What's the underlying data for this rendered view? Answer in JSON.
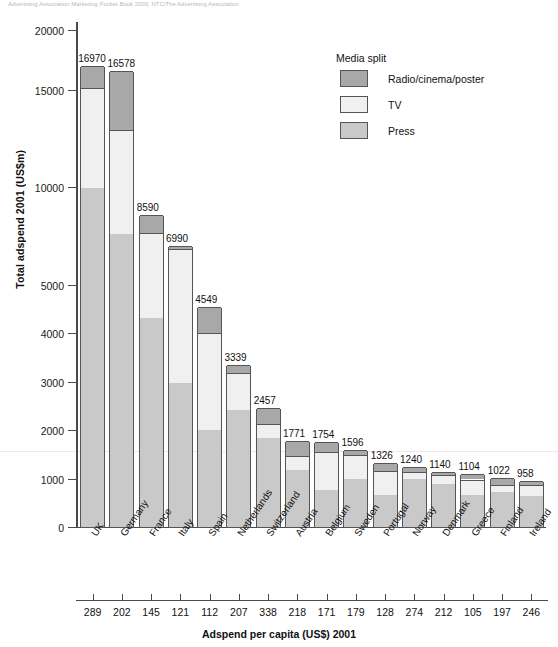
{
  "source_header": "Advertising Association Marketing Pocket Book 2003, NTC/The Advertising Association",
  "axes": {
    "y_title": "Total adspend 2001 (US$m)",
    "x_title": "Adspend per capita (US$) 2001",
    "y_ticks": [
      "20000",
      "15000",
      "10000",
      "5000",
      "4000",
      "3000",
      "2000",
      "1000",
      "0"
    ]
  },
  "legend": {
    "title": "Media split",
    "items": [
      {
        "label": "Radio/cinema/poster",
        "color": "#a8a8a8",
        "key": "radio"
      },
      {
        "label": "TV",
        "color": "#f0f0f0",
        "key": "tv"
      },
      {
        "label": "Press",
        "color": "#c9c9c9",
        "key": "press"
      }
    ]
  },
  "chart_data": {
    "type": "bar",
    "xlabel": "Adspend per capita (US$) 2001",
    "ylabel": "Total adspend 2001 (US$m)",
    "stacked": true,
    "grid": false,
    "legend_position": "top-right",
    "y_axis_note": "broken / non-linear scale: 0-5000 expanded, 5000-20000 compressed",
    "y_ticks": [
      0,
      1000,
      2000,
      3000,
      4000,
      5000,
      10000,
      15000,
      20000
    ],
    "ylim": [
      0,
      20000
    ],
    "categories": [
      "UK",
      "Germany",
      "France",
      "Italy",
      "Spain",
      "Netherlands",
      "Switzerland",
      "Austria",
      "Belgium",
      "Sweden",
      "Portugal",
      "Norway",
      "Denmark",
      "Greece",
      "Finland",
      "Ireland"
    ],
    "totals": [
      16970,
      16578,
      8590,
      6990,
      4549,
      3339,
      2457,
      1771,
      1754,
      1596,
      1326,
      1240,
      1140,
      1104,
      1022,
      958
    ],
    "per_capita": [
      289,
      202,
      145,
      121,
      112,
      207,
      338,
      218,
      171,
      179,
      128,
      274,
      212,
      105,
      197,
      246
    ],
    "series": [
      {
        "name": "Press",
        "values": [
          9950,
          7580,
          4310,
          2985,
          2000,
          2425,
          1845,
          1180,
          770,
          1000,
          670,
          1000,
          900,
          660,
          720,
          640
        ]
      },
      {
        "name": "TV",
        "values": [
          5250,
          5350,
          3330,
          3840,
          2000,
          760,
          290,
          290,
          790,
          480,
          490,
          150,
          180,
          330,
          160,
          230
        ]
      },
      {
        "name": "Radio/cinema/poster",
        "values": [
          1770,
          3648,
          950,
          165,
          549,
          154,
          322,
          301,
          194,
          116,
          166,
          90,
          60,
          114,
          142,
          88
        ]
      }
    ]
  },
  "bars": [
    {
      "country": "UK",
      "total": "16970",
      "per_capita": "289"
    },
    {
      "country": "Germany",
      "total": "16578",
      "per_capita": "202"
    },
    {
      "country": "France",
      "total": "8590",
      "per_capita": "145"
    },
    {
      "country": "Italy",
      "total": "6990",
      "per_capita": "121"
    },
    {
      "country": "Spain",
      "total": "4549",
      "per_capita": "112"
    },
    {
      "country": "Netherlands",
      "total": "3339",
      "per_capita": "207"
    },
    {
      "country": "Switzerland",
      "total": "2457",
      "per_capita": "338"
    },
    {
      "country": "Austria",
      "total": "1771",
      "per_capita": "218"
    },
    {
      "country": "Belgium",
      "total": "1754",
      "per_capita": "171"
    },
    {
      "country": "Sweden",
      "total": "1596",
      "per_capita": "179"
    },
    {
      "country": "Portugal",
      "total": "1326",
      "per_capita": "128"
    },
    {
      "country": "Norway",
      "total": "1240",
      "per_capita": "274"
    },
    {
      "country": "Denmark",
      "total": "1140",
      "per_capita": "212"
    },
    {
      "country": "Greece",
      "total": "1104",
      "per_capita": "105"
    },
    {
      "country": "Finland",
      "total": "1022",
      "per_capita": "197"
    },
    {
      "country": "Ireland",
      "total": "958",
      "per_capita": "246"
    }
  ]
}
